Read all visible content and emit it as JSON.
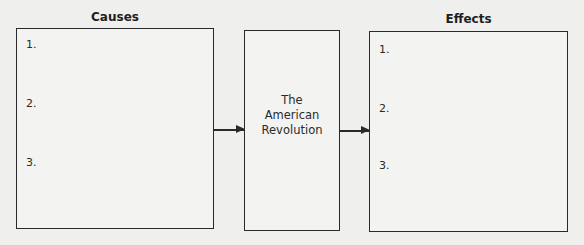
{
  "causes": {
    "heading": "Causes",
    "items": [
      "1.",
      "2.",
      "3."
    ]
  },
  "center": {
    "lines": [
      "The",
      "American",
      "Revolution"
    ]
  },
  "effects": {
    "heading": "Effects",
    "items": [
      "1.",
      "2.",
      "3."
    ]
  },
  "colors": {
    "background": "#efefed",
    "stroke": "#2a2a2a"
  }
}
